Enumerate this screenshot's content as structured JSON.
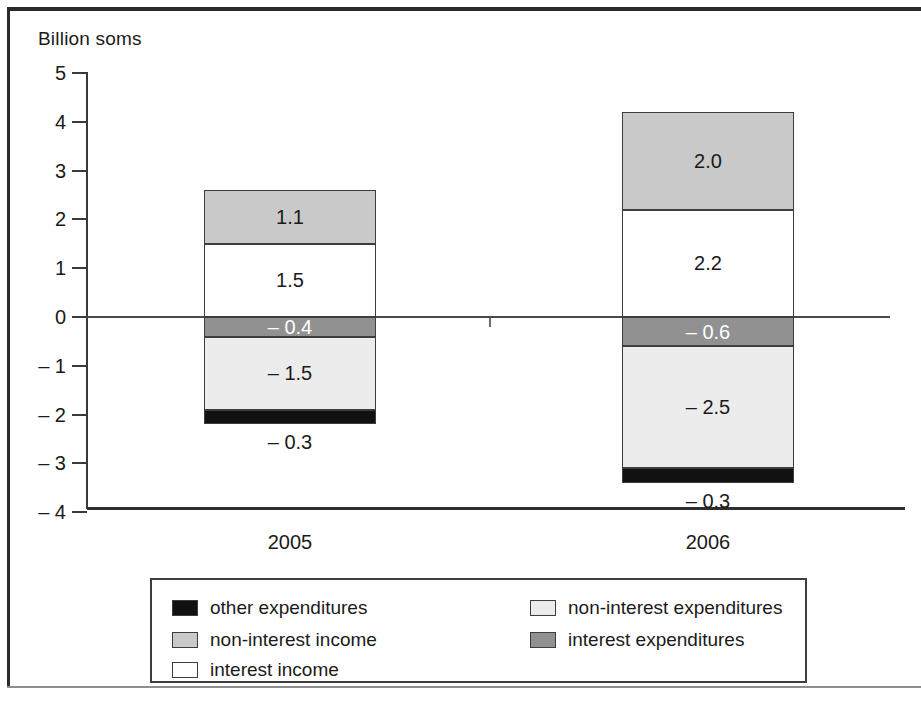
{
  "figure": {
    "axis_title": "Billion soms"
  },
  "chart_data": {
    "type": "bar",
    "subtype": "stacked-diverging",
    "title": "",
    "xlabel": "",
    "ylabel": "Billion soms",
    "ylim": [
      -4,
      5
    ],
    "yticks": [
      5,
      4,
      3,
      2,
      1,
      0,
      -1,
      -2,
      -3,
      -4
    ],
    "ytick_labels": [
      "5",
      "4",
      "3",
      "2",
      "1",
      "0",
      "– 1",
      "– 2",
      "– 3",
      "– 4"
    ],
    "grid": false,
    "legend_position": "bottom",
    "categories": [
      "2005",
      "2006"
    ],
    "series": [
      {
        "name": "non-interest income",
        "color": "#c9c9c9",
        "values": [
          1.1,
          2.0
        ],
        "labels": [
          "1.1",
          "2.0"
        ]
      },
      {
        "name": "interest income",
        "color": "#ffffff",
        "values": [
          1.5,
          2.2
        ],
        "labels": [
          "1.5",
          "2.2"
        ]
      },
      {
        "name": "interest expenditures",
        "color": "#919191",
        "values": [
          -0.4,
          -0.6
        ],
        "labels": [
          "– 0.4",
          "– 0.6"
        ]
      },
      {
        "name": "non-interest expenditures",
        "color": "#ececec",
        "values": [
          -1.5,
          -2.5
        ],
        "labels": [
          "– 1.5",
          "– 2.5"
        ]
      },
      {
        "name": "other expenditures",
        "color": "#111111",
        "values": [
          -0.3,
          -0.3
        ],
        "labels": [
          "– 0.3",
          "– 0.3"
        ]
      }
    ],
    "totals_positive": [
      2.6,
      4.2
    ],
    "totals_negative": [
      -2.2,
      -3.4
    ]
  },
  "legend": {
    "items": [
      {
        "label": "other expenditures",
        "color": "#111111",
        "column": 0,
        "row": 0
      },
      {
        "label": "non-interest expenditures",
        "color": "#ececec",
        "column": 1,
        "row": 0
      },
      {
        "label": "non-interest income",
        "color": "#c9c9c9",
        "column": 0,
        "row": 1
      },
      {
        "label": "interest expenditures",
        "color": "#919191",
        "column": 1,
        "row": 1
      },
      {
        "label": "interest income",
        "color": "#ffffff",
        "column": 0,
        "row": 2
      }
    ]
  }
}
